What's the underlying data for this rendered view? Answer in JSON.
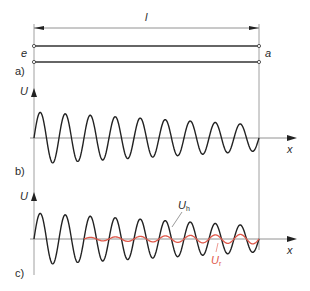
{
  "dimension": {
    "label": "l"
  },
  "line": {
    "input_end_label": "e",
    "output_end_label": "a"
  },
  "panels": [
    {
      "id": "a",
      "label": "a)"
    },
    {
      "id": "b",
      "label": "b)",
      "y_axis_label": "U",
      "x_axis_label": "x"
    },
    {
      "id": "c",
      "label": "c)",
      "y_axis_label": "U",
      "x_axis_label": "x",
      "forward_wave_label": "U",
      "forward_wave_sub": "h",
      "reflected_wave_label": "U",
      "reflected_wave_sub": "r"
    }
  ],
  "colors": {
    "ink": "#2a2a2a",
    "axis": "#555555",
    "reflected": "#e0584a"
  },
  "waves": {
    "x_start": 34,
    "x_end": 259,
    "cycles": 9,
    "amp_start": 26,
    "amp_end": 13,
    "reflected_start_x": 84,
    "reflected_amp_start": 1.5,
    "reflected_amp_end": 5
  }
}
